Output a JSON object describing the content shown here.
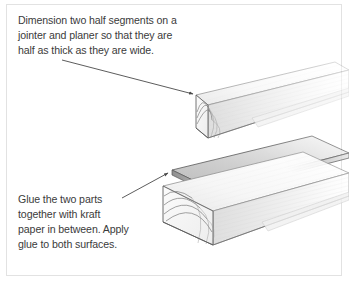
{
  "figure": {
    "background_color": "#ffffff",
    "border_color": "#e2e2e2",
    "text_color": "#3b3b3b",
    "line_color": "#4a4a4a"
  },
  "captions": {
    "top": {
      "text": "Dimension two half segments on a\njointer and planer so that they are\nhalf as thick as they are wide.",
      "lines": [
        "Dimension two half segments on a",
        "jointer and planer so that they are",
        "half as thick as they are wide."
      ]
    },
    "bottom": {
      "text": "Glue the two parts\ntogether with kraft\npaper in between. Apply\nglue to both surfaces.",
      "lines": [
        "Glue the two parts",
        "together with kraft",
        "paper in between. Apply",
        "glue to both surfaces."
      ]
    }
  },
  "leaders": [
    {
      "name": "leader-top",
      "from": [
        62,
        60
      ],
      "to": [
        196,
        96
      ],
      "arrow": "down-right",
      "points_to": "upper-board-top-face"
    },
    {
      "name": "leader-bottom",
      "from": [
        122,
        198
      ],
      "to": [
        170,
        172
      ],
      "arrow": "up-right",
      "points_to": "kraft-paper-sheet"
    }
  ],
  "illustration": {
    "objects": [
      {
        "name": "upper-board",
        "label": "upper half segment",
        "shading": "#f4f4f4"
      },
      {
        "name": "kraft-paper-sheet",
        "label": "kraft paper",
        "shading": "#d6d6d6"
      },
      {
        "name": "lower-board",
        "label": "lower half segment",
        "shading": "#f2f2f2"
      }
    ],
    "end_grain": "concentric growth-ring arcs on both board end faces",
    "projection": "isometric receding to upper right, fading out"
  }
}
